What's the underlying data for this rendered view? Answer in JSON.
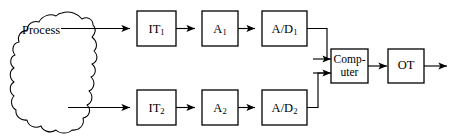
{
  "diagram": {
    "type": "block-diagram",
    "background_color": "#ffffff",
    "stroke_color": "#000000",
    "process": {
      "label": "Process",
      "shape": "irregular-blob"
    },
    "nodes": [
      {
        "id": "it1",
        "base": "IT",
        "subscript": "1",
        "shape": "rectangle"
      },
      {
        "id": "a1",
        "base": "A",
        "subscript": "1",
        "shape": "rectangle"
      },
      {
        "id": "ad1",
        "base": "A/D",
        "subscript": "1",
        "shape": "rectangle"
      },
      {
        "id": "it2",
        "base": "IT",
        "subscript": "2",
        "shape": "rectangle"
      },
      {
        "id": "a2",
        "base": "A",
        "subscript": "2",
        "shape": "rectangle"
      },
      {
        "id": "ad2",
        "base": "A/D",
        "subscript": "2",
        "shape": "rectangle"
      },
      {
        "id": "computer",
        "line1": "Comp-",
        "line2": "uter",
        "shape": "rectangle"
      },
      {
        "id": "ot",
        "base": "OT",
        "subscript": "",
        "shape": "rectangle"
      }
    ],
    "connections": [
      {
        "from": "process",
        "to": "it1",
        "style": "arrow"
      },
      {
        "from": "it1",
        "to": "a1",
        "style": "arrow"
      },
      {
        "from": "a1",
        "to": "ad1",
        "style": "arrow"
      },
      {
        "from": "ad1",
        "to": "computer",
        "style": "arrow-elbow"
      },
      {
        "from": "process",
        "to": "it2",
        "style": "arrow"
      },
      {
        "from": "it2",
        "to": "a2",
        "style": "arrow"
      },
      {
        "from": "a2",
        "to": "ad2",
        "style": "arrow"
      },
      {
        "from": "ad2",
        "to": "computer",
        "style": "arrow-elbow"
      },
      {
        "from": "computer",
        "to": "ot",
        "style": "arrow"
      },
      {
        "from": "ot",
        "to": "output",
        "style": "arrow"
      }
    ]
  }
}
